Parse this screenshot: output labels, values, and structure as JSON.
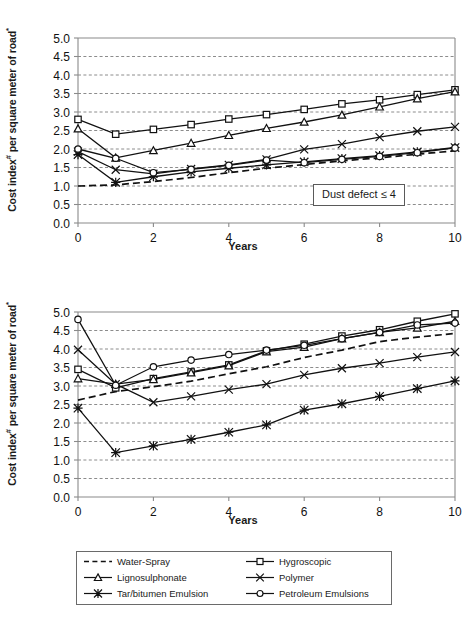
{
  "figure": {
    "ylabel_prefix": "Cost index",
    "ylabel_sup1": "#",
    "ylabel_mid": " per square meter of road",
    "ylabel_sup2": "*",
    "xtitle": "Years"
  },
  "legend": {
    "items": [
      {
        "label": "Water-Spray",
        "marker": "none",
        "dash": true
      },
      {
        "label": "Hygroscopic",
        "marker": "square",
        "dash": false
      },
      {
        "label": "Lignosulphonate",
        "marker": "triangle",
        "dash": false
      },
      {
        "label": "Polymer",
        "marker": "cross",
        "dash": false
      },
      {
        "label": "Tar/bitumen Emulsion",
        "marker": "star",
        "dash": false
      },
      {
        "label": "Petroleum Emulsions",
        "marker": "circle",
        "dash": false
      }
    ]
  },
  "chart_data": [
    {
      "type": "line",
      "title": "Dust defect ≤ 4",
      "annotation": "Dust defect ≤ 4",
      "xlabel": "Years",
      "ylabel": "Cost index# per square meter of road*",
      "x": [
        0,
        1,
        2,
        3,
        4,
        5,
        6,
        7,
        8,
        9,
        10
      ],
      "xlim": [
        0,
        10
      ],
      "ylim": [
        0,
        5
      ],
      "xticks": [
        0,
        2,
        4,
        6,
        8,
        10
      ],
      "yticks": [
        0.0,
        0.5,
        1.0,
        1.5,
        2.0,
        2.5,
        3.0,
        3.5,
        4.0,
        4.5,
        5.0
      ],
      "ytick_labels": [
        "0.0",
        "0.5",
        "1.0",
        "1.5",
        "2.0",
        "2.5",
        "3.0",
        "3.5",
        "4.0",
        "4.5",
        "5.0"
      ],
      "grid": true,
      "legend_position": "below-figure",
      "series": [
        {
          "name": "Water-Spray",
          "marker": "none",
          "dash": true,
          "values": [
            1.0,
            1.03,
            1.12,
            1.23,
            1.36,
            1.48,
            1.58,
            1.68,
            1.76,
            1.86,
            1.95
          ]
        },
        {
          "name": "Hygroscopic",
          "marker": "square",
          "dash": false,
          "values": [
            2.8,
            2.4,
            2.53,
            2.66,
            2.81,
            2.93,
            3.07,
            3.22,
            3.33,
            3.47,
            3.6
          ]
        },
        {
          "name": "Lignosulphonate",
          "marker": "triangle",
          "dash": false,
          "values": [
            2.55,
            1.76,
            1.96,
            2.16,
            2.37,
            2.56,
            2.73,
            2.92,
            3.14,
            3.36,
            3.55
          ]
        },
        {
          "name": "Polymer",
          "marker": "cross",
          "dash": false,
          "values": [
            1.93,
            1.44,
            1.33,
            1.46,
            1.57,
            1.72,
            1.99,
            2.13,
            2.32,
            2.48,
            2.6
          ]
        },
        {
          "name": "Tar/bitumen Emulsion",
          "marker": "star",
          "dash": false,
          "values": [
            1.85,
            1.1,
            1.25,
            1.38,
            1.48,
            1.57,
            1.65,
            1.74,
            1.82,
            1.92,
            2.04
          ]
        },
        {
          "name": "Petroleum Emulsions",
          "marker": "circle",
          "dash": false,
          "values": [
            2.0,
            1.75,
            1.36,
            1.45,
            1.56,
            1.7,
            1.63,
            1.72,
            1.8,
            1.9,
            2.03
          ]
        }
      ]
    },
    {
      "type": "line",
      "title": "Dust defect ≤ 2",
      "annotation": "Dust defect ≤ 2",
      "xlabel": "Years",
      "ylabel": "Cost index# per square meter of road*",
      "x": [
        0,
        1,
        2,
        3,
        4,
        5,
        6,
        7,
        8,
        9,
        10
      ],
      "xlim": [
        0,
        10
      ],
      "ylim": [
        0,
        5
      ],
      "xticks": [
        0,
        2,
        4,
        6,
        8,
        10
      ],
      "yticks": [
        0.0,
        0.5,
        1.0,
        1.5,
        2.0,
        2.5,
        3.0,
        3.5,
        4.0,
        4.5,
        5.0
      ],
      "ytick_labels": [
        "0.0",
        "0.5",
        "1.0",
        "1.5",
        "2.0",
        "2.5",
        "3.0",
        "3.5",
        "4.0",
        "4.5",
        "5.0"
      ],
      "grid": true,
      "legend_position": "below-figure",
      "series": [
        {
          "name": "Water-Spray",
          "marker": "none",
          "dash": true,
          "values": [
            2.62,
            2.85,
            2.98,
            3.13,
            3.33,
            3.52,
            3.77,
            3.97,
            4.2,
            4.32,
            4.42
          ]
        },
        {
          "name": "Hygroscopic",
          "marker": "square",
          "dash": false,
          "values": [
            3.45,
            2.95,
            3.2,
            3.38,
            3.57,
            3.95,
            4.13,
            4.35,
            4.52,
            4.75,
            4.95
          ]
        },
        {
          "name": "Lignosulphonate",
          "marker": "triangle",
          "dash": false,
          "values": [
            3.2,
            3.05,
            3.18,
            3.36,
            3.55,
            3.93,
            4.05,
            4.28,
            4.45,
            4.57,
            4.75
          ]
        },
        {
          "name": "Polymer",
          "marker": "cross",
          "dash": false,
          "values": [
            3.98,
            3.05,
            2.56,
            2.72,
            2.9,
            3.05,
            3.3,
            3.48,
            3.62,
            3.78,
            3.92
          ]
        },
        {
          "name": "Tar/bitumen Emulsion",
          "marker": "star",
          "dash": false,
          "values": [
            2.4,
            1.2,
            1.38,
            1.56,
            1.75,
            1.95,
            2.35,
            2.52,
            2.72,
            2.93,
            3.14
          ]
        },
        {
          "name": "Petroleum Emulsions",
          "marker": "circle",
          "dash": false,
          "values": [
            4.8,
            3.02,
            3.52,
            3.7,
            3.85,
            3.97,
            4.1,
            4.28,
            4.45,
            4.65,
            4.7
          ]
        }
      ]
    }
  ]
}
